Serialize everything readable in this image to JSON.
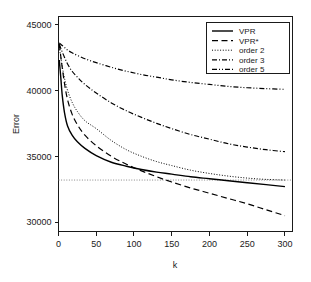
{
  "chart_data": {
    "type": "line",
    "title": "",
    "xlabel": "k",
    "ylabel": "Error",
    "xlim": [
      0,
      310
    ],
    "ylim": [
      29300,
      45600
    ],
    "grid": false,
    "legend_position": "top-right",
    "xticks": [
      0,
      50,
      100,
      150,
      200,
      250,
      300
    ],
    "xtick_labels": [
      "0",
      "50",
      "100",
      "150",
      "200",
      "250",
      "300"
    ],
    "yticks": [
      30000,
      35000,
      40000,
      45000
    ],
    "ytick_labels": [
      "30000",
      "35000",
      "40000",
      "45000"
    ],
    "reference_line": {
      "orientation": "horizontal",
      "y": 33200,
      "style": "dotted",
      "color": "#888888"
    },
    "series": [
      {
        "name": "VPR",
        "style": "solid",
        "color": "#000000",
        "x": [
          1,
          3,
          5,
          8,
          12,
          18,
          25,
          35,
          50,
          70,
          90,
          110,
          130,
          150,
          175,
          200,
          225,
          250,
          275,
          300
        ],
        "values": [
          42300,
          41000,
          39600,
          38300,
          37300,
          36600,
          36100,
          35600,
          35050,
          34550,
          34250,
          34000,
          33800,
          33650,
          33450,
          33300,
          33150,
          33000,
          32850,
          32700
        ]
      },
      {
        "name": "VPR*",
        "style": "dashed",
        "color": "#000000",
        "x": [
          1,
          3,
          5,
          8,
          12,
          18,
          25,
          35,
          50,
          70,
          90,
          110,
          130,
          150,
          175,
          200,
          225,
          250,
          275,
          300
        ],
        "values": [
          43500,
          42600,
          41700,
          40500,
          39300,
          38200,
          37400,
          36600,
          35800,
          35000,
          34400,
          33900,
          33450,
          33050,
          32600,
          32200,
          31800,
          31400,
          30950,
          30500
        ]
      },
      {
        "name": "order 2",
        "style": "dotted",
        "color": "#000000",
        "x": [
          1,
          3,
          5,
          8,
          12,
          18,
          25,
          35,
          50,
          70,
          90,
          110,
          130,
          150,
          175,
          200,
          225,
          250,
          275,
          300
        ],
        "values": [
          43300,
          42500,
          41800,
          40900,
          40000,
          39100,
          38400,
          37700,
          37100,
          36200,
          35500,
          35000,
          34600,
          34300,
          33950,
          33700,
          33500,
          33350,
          33250,
          33200
        ]
      },
      {
        "name": "order 3",
        "style": "dash-dot",
        "color": "#000000",
        "x": [
          1,
          3,
          5,
          8,
          12,
          18,
          25,
          35,
          50,
          70,
          90,
          110,
          130,
          150,
          175,
          200,
          225,
          250,
          275,
          300
        ],
        "values": [
          43500,
          43200,
          42900,
          42500,
          42000,
          41450,
          41000,
          40450,
          39800,
          39050,
          38450,
          37950,
          37500,
          37100,
          36650,
          36300,
          35950,
          35700,
          35500,
          35350
        ]
      },
      {
        "name": "order 5",
        "style": "dash-dot-dot",
        "color": "#000000",
        "x": [
          1,
          3,
          5,
          8,
          12,
          18,
          25,
          35,
          50,
          70,
          90,
          110,
          130,
          150,
          175,
          200,
          225,
          250,
          275,
          300
        ],
        "values": [
          43600,
          43500,
          43400,
          43250,
          43050,
          42850,
          42650,
          42400,
          42100,
          41750,
          41450,
          41200,
          41000,
          40800,
          40600,
          40450,
          40300,
          40200,
          40130,
          40080
        ]
      }
    ]
  },
  "legend": {
    "entries": [
      {
        "label": "VPR"
      },
      {
        "label": "VPR*"
      },
      {
        "label": "order 2"
      },
      {
        "label": "order 3"
      },
      {
        "label": "order 5"
      }
    ]
  }
}
